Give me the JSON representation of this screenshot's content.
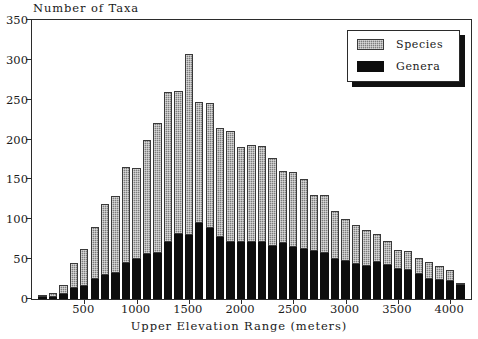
{
  "chart_data": {
    "type": "bar",
    "stacked": true,
    "title": "",
    "ylabel": "Number of Taxa",
    "xlabel": "Upper Elevation Range (meters)",
    "ylim": [
      0,
      350
    ],
    "yticks": [
      0,
      50,
      100,
      150,
      200,
      250,
      300,
      350
    ],
    "xlim": [
      0,
      4200
    ],
    "xticks": [
      500,
      1000,
      1500,
      2000,
      2500,
      3000,
      3500,
      4000
    ],
    "grid": false,
    "legend_position": "top-right",
    "colors": {
      "species": "#7d7d7d",
      "genera": "#0d0d0d",
      "axis": "#2b2b2b"
    },
    "legend": [
      "Species",
      "Genera"
    ],
    "categories": [
      100,
      200,
      300,
      400,
      500,
      600,
      700,
      800,
      900,
      1000,
      1100,
      1200,
      1300,
      1400,
      1500,
      1600,
      1700,
      1800,
      1900,
      2000,
      2100,
      2200,
      2300,
      2400,
      2500,
      2600,
      2700,
      2800,
      2900,
      3000,
      3100,
      3200,
      3300,
      3400,
      3500,
      3600,
      3700,
      3800,
      3900,
      4000,
      4100
    ],
    "series": [
      {
        "name": "Genera",
        "values": [
          2,
          3,
          6,
          14,
          16,
          25,
          30,
          33,
          45,
          50,
          57,
          58,
          72,
          81,
          80,
          95,
          89,
          78,
          71,
          72,
          71,
          72,
          66,
          70,
          65,
          63,
          60,
          58,
          50,
          48,
          44,
          41,
          46,
          43,
          38,
          36,
          32,
          25,
          24,
          22,
          17
        ]
      },
      {
        "name": "Species",
        "values": [
          1,
          4,
          12,
          31,
          47,
          65,
          89,
          96,
          120,
          115,
          142,
          163,
          188,
          180,
          227,
          152,
          157,
          137,
          140,
          119,
          122,
          120,
          111,
          91,
          94,
          87,
          71,
          72,
          61,
          52,
          49,
          46,
          35,
          30,
          23,
          24,
          20,
          21,
          17,
          15,
          3
        ]
      }
    ]
  }
}
